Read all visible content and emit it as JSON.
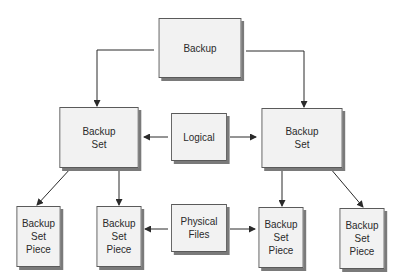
{
  "diagram": {
    "type": "hierarchy",
    "nodes": {
      "backup": {
        "label": "Backup"
      },
      "backup_set_left": {
        "label": "Backup\nSet"
      },
      "logical": {
        "label": "Logical"
      },
      "backup_set_right": {
        "label": "Backup\nSet"
      },
      "piece_1": {
        "label": "Backup\nSet\nPiece"
      },
      "piece_2": {
        "label": "Backup\nSet\nPiece"
      },
      "physical_files": {
        "label": "Physical\nFiles"
      },
      "piece_3": {
        "label": "Backup\nSet\nPiece"
      },
      "piece_4": {
        "label": "Backup\nSet\nPiece"
      }
    },
    "edges": [
      {
        "from": "backup",
        "to": "backup_set_left"
      },
      {
        "from": "backup",
        "to": "backup_set_right"
      },
      {
        "from": "logical",
        "to": "backup_set_left"
      },
      {
        "from": "logical",
        "to": "backup_set_right"
      },
      {
        "from": "backup_set_left",
        "to": "piece_1"
      },
      {
        "from": "backup_set_left",
        "to": "piece_2"
      },
      {
        "from": "backup_set_right",
        "to": "piece_3"
      },
      {
        "from": "backup_set_right",
        "to": "piece_4"
      },
      {
        "from": "physical_files",
        "to": "piece_2"
      },
      {
        "from": "physical_files",
        "to": "piece_3"
      }
    ],
    "colors": {
      "box_fill": "#f2f2f2",
      "box_border": "#5a5a5a",
      "shadow": "#7a7a7a",
      "line": "#2a2a2a",
      "text": "#2a2a2a"
    }
  }
}
